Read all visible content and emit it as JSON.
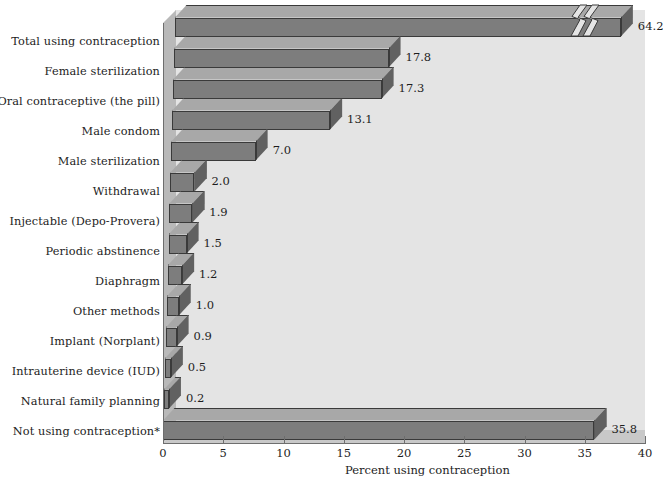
{
  "chart_data": {
    "type": "bar",
    "orientation": "horizontal",
    "title": "",
    "xlabel": "Percent using contraception",
    "ylabel": "",
    "xlim": [
      0,
      40
    ],
    "xticks": [
      0,
      5,
      10,
      15,
      20,
      25,
      30,
      35,
      40
    ],
    "xtick_labels": [
      "0",
      "5",
      "10",
      "15",
      "20",
      "25",
      "30",
      "35",
      "40"
    ],
    "grid": false,
    "legend": null,
    "style": "3d-bar",
    "categories": [
      "Total using contraception",
      "Female sterilization",
      "Oral contraceptive (the pill)",
      "Male condom",
      "Male sterilization",
      "Withdrawal",
      "Injectable (Depo-Provera)",
      "Periodic abstinence",
      "Diaphragm",
      "Other methods",
      "Implant (Norplant)",
      "Intrauterine device (IUD)",
      "Natural family planning",
      "Not using contraception*"
    ],
    "values": [
      64.2,
      17.8,
      17.3,
      13.1,
      7.0,
      2.0,
      1.9,
      1.5,
      1.2,
      1.0,
      0.9,
      0.5,
      0.2,
      35.8
    ],
    "value_labels": [
      "64.2",
      "17.8",
      "17.3",
      "13.1",
      "7.0",
      "2.0",
      "1.9",
      "1.5",
      "1.2",
      "1.0",
      "0.9",
      "0.5",
      "0.2",
      "35.8"
    ],
    "axis_break": {
      "category": "Total using contraception",
      "note": "bar truncated with zigzag break symbol because value exceeds axis maximum",
      "drawn_at_value": 37.0
    },
    "colors": {
      "bar_front": "#7d7d7d",
      "bar_top": "#a8a8a8",
      "bar_side": "#616161",
      "bar_outline": "#3a3a3a",
      "plot_background": "#e4e4e4",
      "wall": "#b9b9b9",
      "floor": "#c8c8c8",
      "axis": "#6e6e6e",
      "text": "#1d1d1d",
      "page_background": "#ffffff"
    }
  }
}
